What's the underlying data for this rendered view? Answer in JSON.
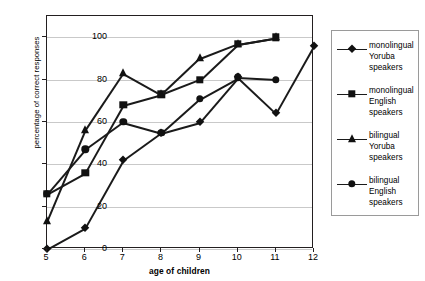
{
  "chart_data": {
    "type": "line",
    "title": "",
    "xlabel": "age of children",
    "ylabel": "percentage of correct responses",
    "x": [
      5,
      6,
      7,
      8,
      9,
      10,
      11,
      12
    ],
    "xticks": [
      "5",
      "6",
      "7",
      "8",
      "9",
      "10",
      "11",
      "12"
    ],
    "yticks": [
      "0",
      "20",
      "40",
      "60",
      "80",
      "100"
    ],
    "xlim": [
      5,
      12
    ],
    "ylim": [
      0,
      110
    ],
    "grid": "horizontal",
    "legend_position": "right",
    "series": [
      {
        "name": "monolingual Yoruba speakers",
        "marker": "diamond",
        "x": [
          5,
          6,
          7,
          8,
          9,
          10,
          11,
          12
        ],
        "values": [
          0,
          10,
          42,
          55,
          60,
          81,
          64,
          96
        ]
      },
      {
        "name": "monolingual English speakers",
        "marker": "square",
        "x": [
          5,
          6,
          7,
          8,
          9,
          10,
          11
        ],
        "values": [
          26,
          36,
          68,
          73,
          80,
          97,
          100
        ]
      },
      {
        "name": "bilingual Yoruba speakers",
        "marker": "triangle",
        "x": [
          5,
          6,
          7,
          8,
          9,
          10,
          11
        ],
        "values": [
          13,
          56,
          83,
          73,
          90,
          97,
          100
        ]
      },
      {
        "name": "bilingual English speakers",
        "marker": "circle",
        "x": [
          5,
          6,
          7,
          8,
          9,
          10,
          11
        ],
        "values": [
          26,
          47,
          60,
          55,
          71,
          81,
          80
        ]
      }
    ]
  },
  "legend": {
    "entries": [
      {
        "line1": "monolingual",
        "line2": "Yoruba",
        "line3": "speakers",
        "marker": "diamond"
      },
      {
        "line1": "monolingual",
        "line2": "English",
        "line3": "speakers",
        "marker": "square"
      },
      {
        "line1": "bilingual",
        "line2": "Yoruba",
        "line3": "speakers",
        "marker": "triangle"
      },
      {
        "line1": "bilingual",
        "line2": "English",
        "line3": "speakers",
        "marker": "circle"
      }
    ]
  },
  "colors": {
    "ink": "#1a1a1a",
    "frame": "#231f20",
    "grid": "#c9c9c9",
    "legend_border": "#9a9a9a",
    "background": "#ffffff"
  }
}
